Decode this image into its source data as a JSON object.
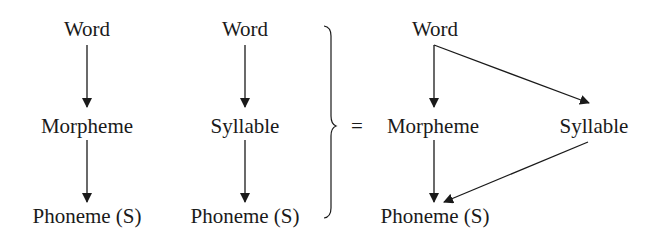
{
  "diagram": {
    "left": {
      "top": "Word",
      "middle": "Morpheme",
      "bottom": "Phoneme (S)"
    },
    "center": {
      "top": "Word",
      "middle": "Syllable",
      "bottom": "Phoneme (S)"
    },
    "equals": "=",
    "right": {
      "top": "Word",
      "middle_left": "Morpheme",
      "middle_right": "Syllable",
      "bottom": "Phoneme (S)"
    },
    "colors": {
      "ink": "#1a1a1a",
      "background": "#ffffff"
    }
  }
}
